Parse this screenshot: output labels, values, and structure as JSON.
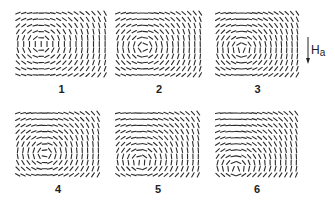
{
  "figure": {
    "grid": {
      "cols": 16,
      "rows": 11
    },
    "color": "#2a2a2a",
    "panels": [
      {
        "label": "1",
        "x": 15,
        "y": 10,
        "w": 93,
        "h": 68,
        "vortex": {
          "cx": 0.28,
          "cy": 0.5,
          "s": 1
        }
      },
      {
        "label": "2",
        "x": 115,
        "y": 10,
        "w": 88,
        "h": 68,
        "vortex": {
          "cx": 0.33,
          "cy": 0.55,
          "s": 1
        }
      },
      {
        "label": "3",
        "x": 215,
        "y": 10,
        "w": 85,
        "h": 68,
        "vortex": {
          "cx": 0.32,
          "cy": 0.58,
          "s": 1
        }
      },
      {
        "label": "4",
        "x": 15,
        "y": 110,
        "w": 86,
        "h": 68,
        "vortex": {
          "cx": 0.35,
          "cy": 0.65,
          "s": 1
        }
      },
      {
        "label": "5",
        "x": 115,
        "y": 110,
        "w": 86,
        "h": 68,
        "vortex": {
          "cx": 0.3,
          "cy": 0.78,
          "s": 1
        }
      },
      {
        "label": "6",
        "x": 215,
        "y": 110,
        "w": 84,
        "h": 68,
        "vortex": {
          "cx": 0.25,
          "cy": 0.9,
          "s": 1
        }
      }
    ],
    "applied_field": {
      "symbol": "H",
      "subscript": "a",
      "direction": "down"
    }
  }
}
